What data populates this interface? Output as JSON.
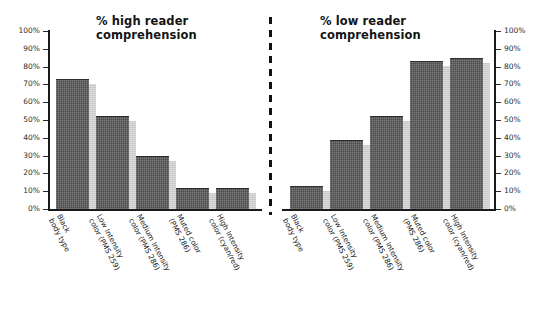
{
  "chart_data": [
    {
      "type": "bar",
      "title": "% high reader\ncomprehension",
      "panel_id": "high",
      "categories": [
        "Black\nbody type",
        "Low Intensity\ncolor (PMS 259)",
        "Medium Intensity\ncolor (PMS 286)",
        "Muted color\n(PMS 286)",
        "High Intensity\ncolor (cyan/red)"
      ],
      "values": [
        73,
        52,
        30,
        12,
        12
      ],
      "xlabel": "",
      "ylabel": "",
      "ylim": [
        0,
        100
      ],
      "ytick_labels": [
        "100%",
        "90%",
        "80%",
        "70%",
        "60%",
        "50%",
        "40%",
        "30%",
        "20%",
        "10%",
        "0%"
      ],
      "ytick_values": [
        100,
        90,
        80,
        70,
        60,
        50,
        40,
        30,
        20,
        10,
        0
      ],
      "axis_position": "left",
      "grid": false,
      "legend": "none",
      "bar_color": "#4c4c4c",
      "bar_shadow_color": "#c9c9c9"
    },
    {
      "type": "bar",
      "title": "% low reader\ncomprehension",
      "panel_id": "low",
      "categories": [
        "Black\nbody type",
        "Low Intensity\ncolor (PMS 259)",
        "Medium Intensity\ncolor (PMS 286)",
        "Muted color\n(PMS 286)",
        "High Intensity\ncolor (cyan/red)"
      ],
      "values": [
        13,
        39,
        52,
        83,
        85
      ],
      "xlabel": "",
      "ylabel": "",
      "ylim": [
        0,
        100
      ],
      "ytick_labels": [
        "100%",
        "90%",
        "80%",
        "70%",
        "60%",
        "50%",
        "40%",
        "30%",
        "20%",
        "10%",
        "0%"
      ],
      "ytick_values": [
        100,
        90,
        80,
        70,
        60,
        50,
        40,
        30,
        20,
        10,
        0
      ],
      "axis_position": "right",
      "grid": false,
      "legend": "none",
      "bar_color": "#4c4c4c",
      "bar_shadow_color": "#c9c9c9"
    }
  ],
  "figure": {
    "divider": "dashed-vertical",
    "background": "#ffffff"
  }
}
